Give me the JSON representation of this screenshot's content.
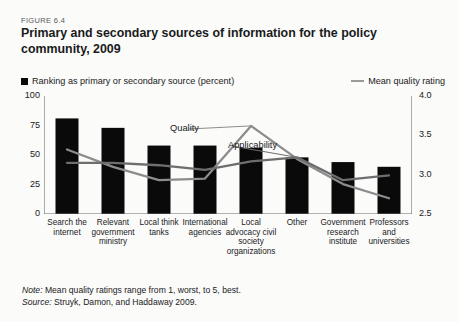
{
  "figure": {
    "number": "FIGURE 6.4",
    "title": "Primary and secondary sources of information for the policy community, 2009"
  },
  "legend": {
    "bar_label": "Ranking as primary or secondary source (percent)",
    "line_label": "Mean quality rating"
  },
  "annotations": {
    "quality": "Quality",
    "applicability": "Applicability"
  },
  "footnotes": {
    "note_prefix": "Note:",
    "note_text": " Mean quality ratings range from 1, worst, to 5, best.",
    "source_prefix": "Source:",
    "source_text": " Struyk, Damon, and Haddaway 2009."
  },
  "colors": {
    "bar": "#0a0a0a",
    "quality_line": "#8c8c8c",
    "applicability_line": "#6e6e6e",
    "axis": "#6b6b6b",
    "background": "#fbfbfa",
    "text": "#1a1a1a"
  },
  "chart_data": {
    "type": "bar",
    "title": "Primary and secondary sources of information for the policy community, 2009",
    "xlabel": "",
    "ylabel": "Ranking as primary or secondary source (percent)",
    "y2label": "Mean quality rating",
    "ylim": [
      0,
      100
    ],
    "y2lim": [
      2.5,
      4.0
    ],
    "yticks": [
      "0",
      "25",
      "50",
      "75",
      "100"
    ],
    "ytick_values": [
      0,
      25,
      50,
      75,
      100
    ],
    "y2ticks": [
      "2.5",
      "3.0",
      "3.5",
      "4.0"
    ],
    "y2tick_values": [
      2.5,
      3.0,
      3.5,
      4.0
    ],
    "grid": false,
    "legend_position": "top",
    "categories": [
      "Search the internet",
      "Relevant government ministry",
      "Local think tanks",
      "International agencies",
      "Local advocacy civil society organizations",
      "Other",
      "Government research institute",
      "Professors and universities"
    ],
    "values": [
      81,
      73,
      58,
      58,
      56,
      48,
      44,
      40
    ],
    "series": [
      {
        "name": "Ranking as primary or secondary source (percent)",
        "type": "bar",
        "axis": "left",
        "values": [
          81,
          73,
          58,
          58,
          56,
          48,
          44,
          40
        ]
      },
      {
        "name": "Quality",
        "type": "line",
        "axis": "right",
        "values": [
          3.32,
          3.1,
          2.93,
          2.95,
          3.62,
          3.2,
          2.88,
          2.7
        ]
      },
      {
        "name": "Applicability",
        "type": "line",
        "axis": "right",
        "values": [
          3.15,
          3.15,
          3.12,
          3.06,
          3.17,
          3.22,
          2.93,
          2.99
        ]
      }
    ]
  }
}
